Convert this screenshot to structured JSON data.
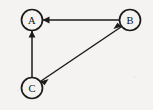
{
  "diagram": {
    "type": "directed-graph",
    "background_color": "#f4f3f1",
    "ink_color": "#1c1b1a",
    "width": 153,
    "height": 110,
    "node_radius": 10.5,
    "nodes": [
      {
        "id": "A",
        "label": "A",
        "cx": 32,
        "cy": 20
      },
      {
        "id": "B",
        "label": "B",
        "cx": 130,
        "cy": 20
      },
      {
        "id": "C",
        "label": "C",
        "cx": 32,
        "cy": 88
      }
    ],
    "edges": [
      {
        "id": "B-to-A",
        "from": "B",
        "to": "A",
        "direction": "one-way",
        "arrow_at": "A",
        "path": "M 119.5 20 L 42.5 20",
        "head_points": "42.5,20 49.5,16.6 49.5,23.4"
      },
      {
        "id": "C-to-A",
        "from": "C",
        "to": "A",
        "direction": "one-way",
        "arrow_at": "A",
        "path": "M 32 77.5 L 32 30.5",
        "head_points": "32,30.5 28.6,37.5 35.4,37.5"
      },
      {
        "id": "C-and-B",
        "from": "C",
        "to": "B",
        "direction": "two-way",
        "arrow_at": "both",
        "path": "M 40.3 81.5 L 121.7 26.5",
        "head_points_start": "40.3,81.5 48.6,78.9 44.6,85.3",
        "head_points_end": "121.7,26.5 113.4,29.1 117.4,22.7"
      }
    ]
  }
}
